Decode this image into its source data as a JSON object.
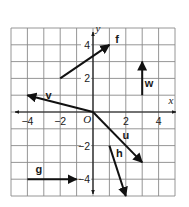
{
  "diagram": {
    "title": "",
    "grid": {
      "xmin": -5,
      "xmax": 5,
      "ymin": -5,
      "ymax": 5,
      "grid_color": "#8a8a8a",
      "axis_color": "#1a1a1a",
      "vector_color": "#111111"
    },
    "axes": {
      "x_label": "x",
      "y_label": "y",
      "origin_label": "O",
      "x_ticks": [
        {
          "value": -4,
          "label": "−4"
        },
        {
          "value": -2,
          "label": "−2"
        },
        {
          "value": 2,
          "label": "2"
        },
        {
          "value": 4,
          "label": "4"
        }
      ],
      "y_ticks": [
        {
          "value": 4,
          "label": "4"
        },
        {
          "value": 2,
          "label": "2"
        },
        {
          "value": -2,
          "label": "−2"
        },
        {
          "value": -4,
          "label": "−4"
        }
      ]
    },
    "vectors": [
      {
        "name": "f",
        "from": [
          -2,
          2
        ],
        "to": [
          1,
          4
        ],
        "label_pos": [
          1.35,
          4.1
        ]
      },
      {
        "name": "w",
        "from": [
          3,
          1
        ],
        "to": [
          3,
          3
        ],
        "label_pos": [
          3.15,
          1.5
        ]
      },
      {
        "name": "v",
        "from": [
          0,
          0
        ],
        "to": [
          -4,
          1
        ],
        "label_pos": [
          -2.9,
          0.75
        ]
      },
      {
        "name": "u",
        "from": [
          0,
          0
        ],
        "to": [
          3,
          -3
        ],
        "label_pos": [
          1.8,
          -1.6
        ]
      },
      {
        "name": "h",
        "from": [
          1,
          -2
        ],
        "to": [
          2,
          -5
        ],
        "label_pos": [
          1.4,
          -2.7
        ]
      },
      {
        "name": "g",
        "from": [
          -4,
          -4
        ],
        "to": [
          -1,
          -4
        ],
        "label_pos": [
          -3.5,
          -3.65
        ]
      }
    ]
  }
}
